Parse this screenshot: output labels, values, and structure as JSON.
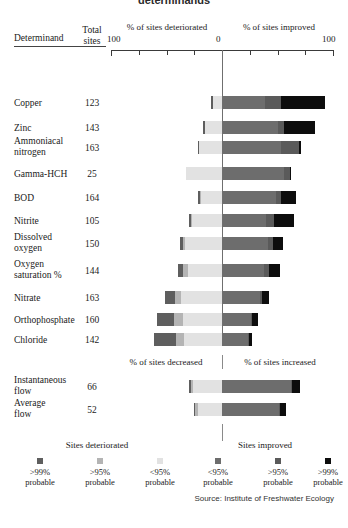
{
  "title": "determinands",
  "headers": {
    "determinand": "Determinand",
    "total_sites_line1": "Total",
    "total_sites_line2": "sites",
    "deteriorated": "% of sites deteriorated",
    "improved": "% of sites improved",
    "axis_left": "100",
    "axis_center": "0",
    "axis_right": "100"
  },
  "flow_headers": {
    "decreased": "% of sites decreased",
    "increased": "% of sites increased"
  },
  "legend": {
    "group_left": "Sites deteriorated",
    "group_right": "Sites improved",
    "items": [
      {
        "label1": ">99%",
        "label2": "probable",
        "color": "#5e5e5e"
      },
      {
        "label1": ">95%",
        "label2": "probable",
        "color": "#b4b4b4"
      },
      {
        "label1": "<95%",
        "label2": "probable",
        "color": "#e2e2e2"
      },
      {
        "label1": "<95%",
        "label2": "probable",
        "color": "#6d6d6d"
      },
      {
        "label1": ">95%",
        "label2": "probable",
        "color": "#5a5a5a"
      },
      {
        "label1": ">99%",
        "label2": "probable",
        "color": "#0d0d0d"
      }
    ]
  },
  "source": "Source: Institute of Freshwater Ecology",
  "colors": {
    "det_99": "#5e5e5e",
    "det_95": "#b4b4b4",
    "det_lt95": "#e2e2e2",
    "imp_lt95": "#6d6d6d",
    "imp_95": "#5a5a5a",
    "imp_99": "#0d0d0d",
    "axis": "#3a3a3a",
    "zero": "#6f6f6f"
  },
  "chart_data": {
    "type": "bar",
    "title": "determinands",
    "xlabel": "",
    "ylabel": "Determinand",
    "xlim": [
      -100,
      100
    ],
    "grid": false,
    "legend_position": "bottom",
    "axis_note": "Diverging stacked bar: left of zero = % sites deteriorated, right of zero = % sites improved",
    "series": [
      {
        "name": ">99% probable deteriorated",
        "side": "left",
        "color": "#5e5e5e"
      },
      {
        "name": ">95% probable deteriorated",
        "side": "left",
        "color": "#b4b4b4"
      },
      {
        "name": "<95% probable deteriorated",
        "side": "left",
        "color": "#e2e2e2"
      },
      {
        "name": "<95% probable improved",
        "side": "right",
        "color": "#6d6d6d"
      },
      {
        "name": ">95% probable improved",
        "side": "right",
        "color": "#5a5a5a"
      },
      {
        "name": ">99% probable improved",
        "side": "right",
        "color": "#0d0d0d"
      }
    ],
    "rows": [
      {
        "determinand": "Copper",
        "total_sites": 123,
        "det_99": 2,
        "det_95": 0,
        "det_lt95": 8,
        "imp_lt95": 39,
        "imp_95": 14,
        "imp_99": 40
      },
      {
        "determinand": "Zinc",
        "total_sites": 143,
        "det_99": 2,
        "det_95": 0,
        "det_lt95": 15,
        "imp_lt95": 50,
        "imp_95": 6,
        "imp_99": 28
      },
      {
        "determinand": "Ammoniacal nitrogen",
        "total_sites": 163,
        "det_99": 1,
        "det_95": 0,
        "det_lt95": 21,
        "imp_lt95": 53,
        "imp_95": 16,
        "imp_99": 2
      },
      {
        "determinand": "Gamma-HCH",
        "total_sites": 25,
        "det_99": 0,
        "det_95": 0,
        "det_lt95": 32,
        "imp_lt95": 56,
        "imp_95": 5,
        "imp_99": 1
      },
      {
        "determinand": "BOD",
        "total_sites": 164,
        "det_99": 2,
        "det_95": 1,
        "det_lt95": 19,
        "imp_lt95": 49,
        "imp_95": 4,
        "imp_99": 14
      },
      {
        "determinand": "Nitrite",
        "total_sites": 105,
        "det_99": 2,
        "det_95": 1,
        "det_lt95": 27,
        "imp_lt95": 40,
        "imp_95": 7,
        "imp_99": 18
      },
      {
        "determinand": "Dissolved oxygen",
        "total_sites": 150,
        "det_99": 3,
        "det_95": 2,
        "det_lt95": 33,
        "imp_lt95": 41,
        "imp_95": 5,
        "imp_99": 9
      },
      {
        "determinand": "Oxygen saturation %",
        "total_sites": 144,
        "det_99": 5,
        "det_95": 4,
        "det_lt95": 31,
        "imp_lt95": 38,
        "imp_95": 4,
        "imp_99": 10
      },
      {
        "determinand": "Nitrate",
        "total_sites": 163,
        "det_99": 9,
        "det_95": 5,
        "det_lt95": 37,
        "imp_lt95": 34,
        "imp_95": 2,
        "imp_99": 6
      },
      {
        "determinand": "Orthophosphate",
        "total_sites": 160,
        "det_99": 16,
        "det_95": 8,
        "det_lt95": 35,
        "imp_lt95": 26,
        "imp_95": 1,
        "imp_99": 5
      },
      {
        "determinand": "Chloride",
        "total_sites": 142,
        "det_99": 20,
        "det_95": 7,
        "det_lt95": 34,
        "imp_lt95": 23,
        "imp_95": 1,
        "imp_99": 3
      }
    ],
    "flow_rows": [
      {
        "determinand": "Instantaneous flow",
        "total_sites": 66,
        "det_99": 2,
        "det_95": 2,
        "det_lt95": 26,
        "imp_lt95": 62,
        "imp_95": 1,
        "imp_99": 7
      },
      {
        "determinand": "Average flow",
        "total_sites": 52,
        "det_99": 1,
        "det_95": 2,
        "det_lt95": 22,
        "imp_lt95": 51,
        "imp_95": 1,
        "imp_99": 6
      }
    ]
  }
}
